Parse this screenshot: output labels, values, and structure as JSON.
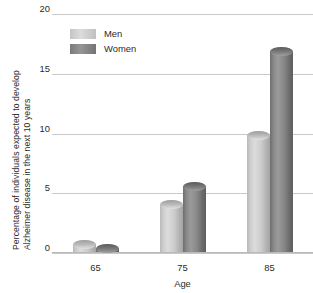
{
  "chart_data": {
    "type": "bar",
    "title": "",
    "subtitle": "",
    "xlabel": "Age",
    "ylabel": "Percentage of individuals expected to develop Alzheimer disease in the next 10 years",
    "ylabel_lines": [
      "Percentage of individuals expected to develop",
      "Alzheimer disease in the next 10 years"
    ],
    "categories": [
      "65",
      "75",
      "85"
    ],
    "series": [
      {
        "name": "Men",
        "values": [
          0.7,
          4.0,
          9.8
        ],
        "color": "#cfcfcf"
      },
      {
        "name": "Women",
        "values": [
          0.3,
          5.5,
          16.8
        ],
        "color": "#8a8a8a"
      }
    ],
    "ylim": [
      0,
      20
    ],
    "yticks": [
      0,
      5,
      10,
      15,
      20
    ],
    "ytick_labels": [
      "0",
      "5",
      "10",
      "15",
      "20"
    ],
    "grid": "horizontal",
    "legend_position": "top-left-inside",
    "legend_entries": [
      "Men",
      "Women"
    ]
  }
}
